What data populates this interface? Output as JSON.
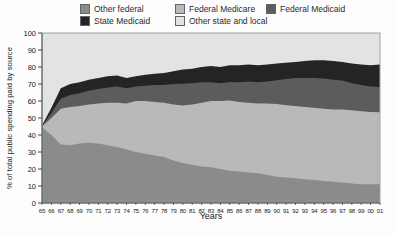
{
  "figure": {
    "xlabel": "Years",
    "ylabel": "% of total public spending paid by source"
  },
  "legend": {
    "items": [
      {
        "label": "Other federal",
        "color": "#8b8b8b"
      },
      {
        "label": "Federal Medicare",
        "color": "#b9b9b9"
      },
      {
        "label": "Federal Medicaid",
        "color": "#5c5c5c"
      },
      {
        "label": "State Medicaid",
        "color": "#242424"
      },
      {
        "label": "Other state and local",
        "color": "#e3e3e3"
      }
    ]
  },
  "chart_data": {
    "type": "area",
    "stacked": true,
    "unit": "percent",
    "title": "",
    "xlabel": "Years",
    "ylabel": "% of total public spending paid by source",
    "ylim": [
      0,
      100
    ],
    "yticks": [
      0,
      10,
      20,
      30,
      40,
      50,
      60,
      70,
      80,
      90,
      100
    ],
    "legend_position": "top",
    "grid": false,
    "x_labels": [
      "65",
      "66",
      "67",
      "68",
      "69",
      "70",
      "71",
      "72",
      "73",
      "74",
      "75",
      "76",
      "77",
      "78",
      "79",
      "80",
      "81",
      "82",
      "83",
      "84",
      "85",
      "86",
      "87",
      "88",
      "89",
      "90",
      "91",
      "92",
      "93",
      "94",
      "95",
      "96",
      "97",
      "98",
      "99",
      "00",
      "01"
    ],
    "series": [
      {
        "name": "Other federal",
        "color": "#8b8b8b",
        "values": [
          44.5,
          40,
          34.5,
          34,
          35,
          35.5,
          35,
          34,
          33,
          31.5,
          30,
          29,
          28,
          27,
          25,
          23.5,
          22.5,
          21.5,
          21,
          20,
          19,
          18.5,
          18,
          17.5,
          16.5,
          15.5,
          15,
          14.5,
          14,
          13.5,
          13,
          12.5,
          12,
          11.5,
          11,
          11,
          11
        ]
      },
      {
        "name": "Federal Medicare",
        "color": "#b9b9b9",
        "values": [
          0.5,
          10,
          20.9,
          22.5,
          22,
          22.5,
          23.5,
          25,
          26,
          27,
          30,
          31,
          31.5,
          32,
          33,
          33.8,
          35.5,
          37.5,
          39,
          40,
          41.3,
          41,
          41,
          41,
          42,
          42.8,
          42.5,
          42.5,
          42.5,
          42.5,
          42.4,
          42.5,
          43,
          43,
          43,
          42.5,
          42.4
        ]
      },
      {
        "name": "Federal Medicaid",
        "color": "#5c5c5c",
        "values": [
          0.3,
          3,
          5.9,
          7,
          7.5,
          8,
          8.5,
          9,
          9.5,
          9,
          8.5,
          9,
          10,
          10.5,
          12,
          12.9,
          12.5,
          12,
          11,
          10.5,
          10.9,
          11.5,
          12.5,
          12.5,
          13,
          13.9,
          15.5,
          16.5,
          17,
          17.5,
          17.8,
          17.5,
          17,
          16,
          15.5,
          15,
          14.9
        ]
      },
      {
        "name": "State Medicaid",
        "color": "#242424",
        "values": [
          0.3,
          3,
          6.2,
          6.5,
          6.5,
          6.5,
          6.5,
          6.5,
          6.5,
          6,
          6,
          6.5,
          6.5,
          7,
          7.5,
          8.3,
          8.5,
          9,
          9.5,
          9.5,
          9.8,
          10,
          10,
          10,
          10,
          9.8,
          9.5,
          9.5,
          10,
          10.5,
          10.8,
          11,
          11,
          11.5,
          12,
          12.5,
          13.2
        ]
      },
      {
        "name": "Other state and local",
        "color": "#e3e3e3",
        "values": [
          54.4,
          44,
          32.5,
          30,
          29,
          27.5,
          26.5,
          25.5,
          25,
          26.5,
          25.5,
          24.5,
          24,
          23.5,
          22.5,
          21.5,
          21,
          20,
          19.5,
          20,
          19,
          19,
          18.5,
          19,
          18.5,
          18,
          17.5,
          17,
          16.5,
          16,
          16,
          16.5,
          17,
          18,
          18.5,
          19,
          18.5
        ]
      }
    ]
  }
}
